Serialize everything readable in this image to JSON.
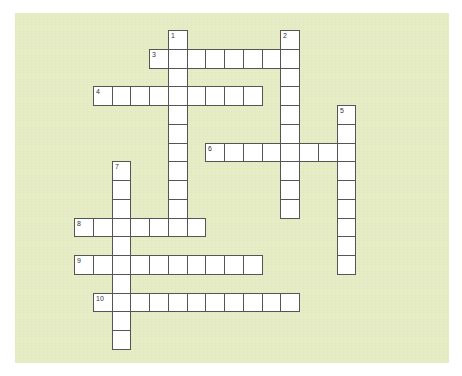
{
  "puzzle": {
    "background_color": "#e5ecc3",
    "cell_border_color": "#555555",
    "cell_fill_color": "#ffffff",
    "grid": {
      "origin_x": 74,
      "origin_y": 30,
      "cell_size": 18.75
    },
    "words": [
      {
        "number": "1",
        "direction": "down",
        "row": 0,
        "col": 5,
        "length": 11
      },
      {
        "number": "2",
        "direction": "down",
        "row": 0,
        "col": 11,
        "length": 10
      },
      {
        "number": "3",
        "direction": "across",
        "row": 1,
        "col": 4,
        "length": 8
      },
      {
        "number": "4",
        "direction": "across",
        "row": 3,
        "col": 1,
        "length": 9
      },
      {
        "number": "5",
        "direction": "down",
        "row": 4,
        "col": 14,
        "length": 9
      },
      {
        "number": "6",
        "direction": "across",
        "row": 6,
        "col": 7,
        "length": 8
      },
      {
        "number": "7",
        "direction": "down",
        "row": 7,
        "col": 2,
        "length": 10
      },
      {
        "number": "8",
        "direction": "across",
        "row": 10,
        "col": 0,
        "length": 7
      },
      {
        "number": "9",
        "direction": "across",
        "row": 12,
        "col": 0,
        "length": 10
      },
      {
        "number": "10",
        "direction": "across",
        "row": 14,
        "col": 1,
        "length": 11
      }
    ]
  }
}
